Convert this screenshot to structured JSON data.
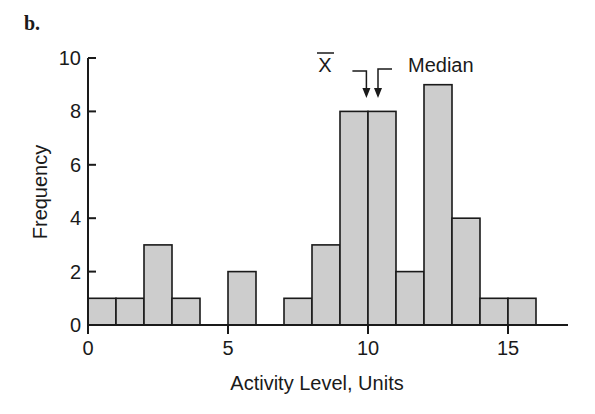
{
  "panel_label": "b.",
  "chart_data": {
    "type": "bar",
    "subtype": "histogram",
    "title": "",
    "xlabel": "Activity Level, Units",
    "ylabel": "Frequency",
    "xlim": [
      0,
      17
    ],
    "ylim": [
      0,
      10
    ],
    "x_ticks": [
      0,
      5,
      10,
      15
    ],
    "y_ticks": [
      0,
      2,
      4,
      6,
      8,
      10
    ],
    "bin_width": 1,
    "bins": [
      {
        "start": 0,
        "end": 1,
        "count": 1
      },
      {
        "start": 1,
        "end": 2,
        "count": 1
      },
      {
        "start": 2,
        "end": 3,
        "count": 3
      },
      {
        "start": 3,
        "end": 4,
        "count": 1
      },
      {
        "start": 4,
        "end": 5,
        "count": 0
      },
      {
        "start": 5,
        "end": 6,
        "count": 2
      },
      {
        "start": 6,
        "end": 7,
        "count": 0
      },
      {
        "start": 7,
        "end": 8,
        "count": 1
      },
      {
        "start": 8,
        "end": 9,
        "count": 3
      },
      {
        "start": 9,
        "end": 10,
        "count": 8
      },
      {
        "start": 10,
        "end": 11,
        "count": 8
      },
      {
        "start": 11,
        "end": 12,
        "count": 2
      },
      {
        "start": 12,
        "end": 13,
        "count": 9
      },
      {
        "start": 13,
        "end": 14,
        "count": 4
      },
      {
        "start": 14,
        "end": 15,
        "count": 1
      },
      {
        "start": 15,
        "end": 16,
        "count": 1
      }
    ],
    "annotations": [
      {
        "label": "X̄",
        "kind": "mean",
        "x": 9.8
      },
      {
        "label": "Median",
        "kind": "median",
        "x": 10.5
      }
    ],
    "grid": false,
    "legend": null,
    "colors": {
      "bar_fill": "#cdcdcd",
      "bar_edge": "#1a1a1a",
      "axis": "#1a1a1a"
    }
  }
}
